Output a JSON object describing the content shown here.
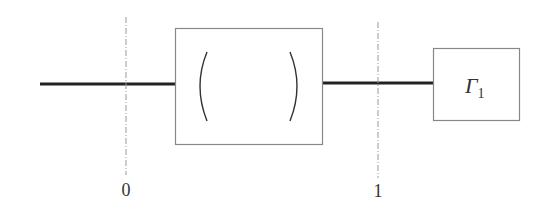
{
  "diagram": {
    "type": "two-port error network block diagram",
    "colors": {
      "line": "#222222",
      "box_border": "#888888",
      "dashed": "#999999",
      "text": "#333333",
      "background": "#ffffff"
    },
    "error_box": {
      "matrix": {
        "rows": [
          [
            {
              "symbol": "e",
              "subscript": "00"
            },
            {
              "symbol": "e",
              "subscript": "01"
            }
          ],
          [
            {
              "symbol": "e",
              "subscript": "10"
            },
            {
              "symbol": "e",
              "subscript": "11"
            }
          ]
        ]
      },
      "e00_symbol": "e",
      "e00_sub": "00",
      "e01_symbol": "e",
      "e01_sub": "01",
      "e10_symbol": "e",
      "e10_sub": "10",
      "e11_symbol": "e",
      "e11_sub": "11"
    },
    "load_box": {
      "symbol": "Γ",
      "subscript": "1"
    },
    "reference_planes": [
      {
        "label": "0"
      },
      {
        "label": "1"
      }
    ],
    "plane0_label": "0",
    "plane1_label": "1"
  }
}
